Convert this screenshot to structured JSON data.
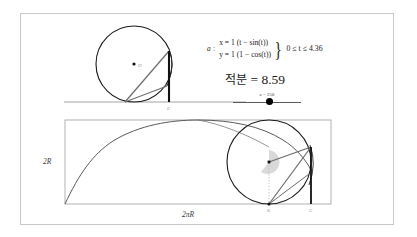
{
  "applet": {
    "name": "cycloid-construction-applet"
  },
  "algebra": {
    "object_name": "a",
    "colon": ":",
    "equation_x": "x = 1 (t − sin(t))",
    "equation_y": "y = 1 (1 − cos(t))",
    "brace": "}",
    "range": "0 ≤ t ≤ 4.36"
  },
  "integral": {
    "label": "적분",
    "equals": "=",
    "value": "8.59",
    "full_text": "적분 = 8.59"
  },
  "slider": {
    "caption": "a = 250",
    "variable": "a",
    "value": "250",
    "handle_position_percent": 50
  },
  "figure_top": {
    "name": "rolling-circle-top",
    "center_label": "D",
    "base_point_label": "E",
    "baseline_name": "tangent-baseline"
  },
  "figure_bottom": {
    "name": "cycloid-arch-diagram",
    "height_label": "2R",
    "width_label": "2πR",
    "point_b_label": "B",
    "point_g_label": "G",
    "center_label": "C"
  },
  "colors": {
    "frame_border": "#c9c9c9",
    "rect_border": "#a8a8a8",
    "circle_stroke": "#1a1a1a",
    "curve_stroke": "#555555",
    "chord_stroke": "#6b6b6b",
    "vertical_bar": "#111111",
    "angle_fill": "#d9d9d9",
    "label_gray": "#9a9a9a",
    "background": "#ffffff"
  }
}
